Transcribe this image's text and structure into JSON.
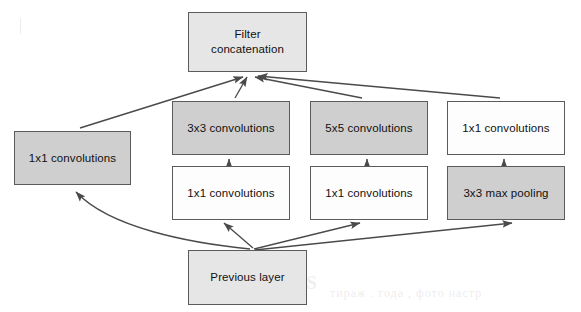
{
  "figure": {
    "background_color": "#ffffff",
    "edge_color": "#4a4a4a",
    "text_color": "#111111",
    "border_color": "#5b5b5b",
    "fills": {
      "white": "#fdfdfd",
      "light_gray": "#e6e6e6",
      "gray": "#cfcfcf"
    }
  },
  "nodes": [
    {
      "id": "filter-concatenation",
      "label": "Filter\nconcatenation",
      "fill": "light_gray",
      "x": 188,
      "y": 12,
      "w": 119,
      "h": 60
    },
    {
      "id": "conv-3x3",
      "label": "3x3 convolutions",
      "fill": "gray",
      "x": 172,
      "y": 101,
      "w": 118,
      "h": 54
    },
    {
      "id": "conv-5x5",
      "label": "5x5 convolutions",
      "fill": "gray",
      "x": 310,
      "y": 101,
      "w": 118,
      "h": 54
    },
    {
      "id": "conv-1x1-pool-branch",
      "label": "1x1 convolutions",
      "fill": "white",
      "x": 447,
      "y": 101,
      "w": 118,
      "h": 54
    },
    {
      "id": "conv-1x1-reduce-3x3",
      "label": "1x1 convolutions",
      "fill": "white",
      "x": 172,
      "y": 166,
      "w": 118,
      "h": 54
    },
    {
      "id": "conv-1x1-reduce-5x5",
      "label": "1x1 convolutions",
      "fill": "white",
      "x": 310,
      "y": 166,
      "w": 118,
      "h": 54
    },
    {
      "id": "maxpool-3x3",
      "label": "3x3 max pooling",
      "fill": "gray",
      "x": 447,
      "y": 166,
      "w": 118,
      "h": 54
    },
    {
      "id": "conv-1x1-direct",
      "label": "1x1 convolutions",
      "fill": "gray",
      "x": 14,
      "y": 131,
      "w": 117,
      "h": 54
    },
    {
      "id": "previous-layer",
      "label": "Previous layer",
      "fill": "light_gray",
      "x": 188,
      "y": 250,
      "w": 119,
      "h": 55
    }
  ],
  "edges": [
    {
      "id": "edge-previous-to-1x1-direct",
      "from": "previous-layer",
      "to": "conv-1x1-direct",
      "style": "curved"
    },
    {
      "id": "edge-previous-to-reduce-3x3",
      "from": "previous-layer",
      "to": "conv-1x1-reduce-3x3",
      "style": "straight"
    },
    {
      "id": "edge-previous-to-reduce-5x5",
      "from": "previous-layer",
      "to": "conv-1x1-reduce-5x5",
      "style": "straight"
    },
    {
      "id": "edge-previous-to-maxpool",
      "from": "previous-layer",
      "to": "maxpool-3x3",
      "style": "straight"
    },
    {
      "id": "edge-reduce-3x3-to-conv-3x3",
      "from": "conv-1x1-reduce-3x3",
      "to": "conv-3x3",
      "style": "vertical"
    },
    {
      "id": "edge-reduce-5x5-to-conv-5x5",
      "from": "conv-1x1-reduce-5x5",
      "to": "conv-5x5",
      "style": "vertical"
    },
    {
      "id": "edge-maxpool-to-conv-1x1",
      "from": "maxpool-3x3",
      "to": "conv-1x1-pool-branch",
      "style": "vertical"
    },
    {
      "id": "edge-1x1-direct-to-concat",
      "from": "conv-1x1-direct",
      "to": "filter-concatenation",
      "style": "straight"
    },
    {
      "id": "edge-conv-3x3-to-concat",
      "from": "conv-3x3",
      "to": "filter-concatenation",
      "style": "straight"
    },
    {
      "id": "edge-conv-5x5-to-concat",
      "from": "conv-5x5",
      "to": "filter-concatenation",
      "style": "straight"
    },
    {
      "id": "edge-pool-1x1-to-concat",
      "from": "conv-1x1-pool-branch",
      "to": "filter-concatenation",
      "style": "straight"
    }
  ],
  "bleedthrough": {
    "note": "faint reverse-side page text visible through the paper",
    "items": [
      {
        "text": "CSZOIS",
        "x": 232,
        "y": 272,
        "size": "big"
      },
      {
        "text": "тираж . года , фото настр",
        "x": 330,
        "y": 286,
        "size": "small"
      }
    ]
  }
}
